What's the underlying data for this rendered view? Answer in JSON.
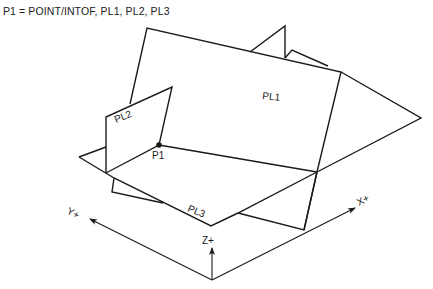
{
  "caption": "P1 = POINT/INTOF, PL1, PL2, PL3",
  "planes": {
    "pl1": {
      "label": "PL1"
    },
    "pl2": {
      "label": "PL2"
    },
    "pl3": {
      "label": "PL3"
    }
  },
  "point": {
    "label": "P1"
  },
  "axes": {
    "x": {
      "label": "X+"
    },
    "y": {
      "label": "Y+"
    },
    "z": {
      "label": "Z+"
    }
  },
  "colors": {
    "line": "#1a1a1a",
    "background": "#ffffff"
  }
}
